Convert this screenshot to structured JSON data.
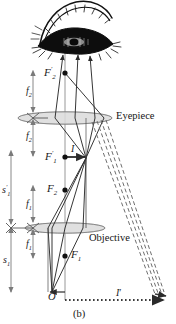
{
  "figure": {
    "caption": "(b)",
    "type": "optical-ray-diagram"
  },
  "components": {
    "eyepiece_label": "Eyepiece",
    "objective_label": "Objective",
    "eye_icon": "eye-illustration"
  },
  "points": {
    "F2_prime": "F′2",
    "F1_prime": "F′1",
    "F2": "F2",
    "F1": "F1",
    "O": "O"
  },
  "point_labels": {
    "f2_prime_base": "F",
    "f2_prime_sub": "2",
    "f1_prime_base": "F",
    "f1_prime_sub": "1",
    "f2_base": "F",
    "f2_sub": "2",
    "f1_base": "F",
    "f1_sub": "1",
    "origin": "O"
  },
  "distances": {
    "f2_upper": "f",
    "f2_upper_sub": "2",
    "f2_lower": "f",
    "f2_lower_sub": "2",
    "f1_upper": "f",
    "f1_upper_sub": "1",
    "f1_lower": "f",
    "f1_lower_sub": "1",
    "s1_prime": "s",
    "s1_prime_sub": "1",
    "s1": "s",
    "s1_sub": "1"
  },
  "images": {
    "intermediate_image": "I",
    "final_image": "I",
    "final_image_prime": "′"
  },
  "colors": {
    "ray_solid": "#2b2b2b",
    "ray_dashed": "#6e6e6e",
    "lens_fill": "#d9d9d9",
    "lens_stroke": "#8a8a8a",
    "axis": "#7a7a7a",
    "point": "#111111",
    "text": "#141414",
    "background": "#ffffff"
  },
  "geometry": {
    "optic_axis_x": 65,
    "eyepiece_y": 118,
    "objective_y": 228,
    "F2_prime_y": 73,
    "F1_prime_y": 157,
    "F2_y": 190,
    "F1_y": 256,
    "O_y": 292,
    "final_image_x": 165,
    "final_image_y": 294
  }
}
